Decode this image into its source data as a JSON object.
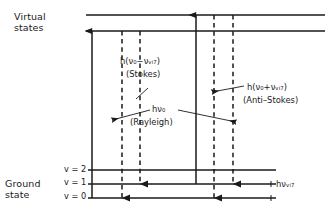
{
  "diagram": {
    "title_semantic": "raman-scattering-energy-level-diagram",
    "labels": {
      "virtual_states": "Virtual\nstates",
      "virtual_states_line1": "Virtual",
      "virtual_states_line2": "states",
      "ground_state_line1": "Ground",
      "ground_state_line2": "state",
      "v2": "v = 2",
      "v1": "v = 1",
      "v0": "v = 0",
      "stokes_energy": "h(ν₀−νᵥᵢ₇)",
      "stokes_name": "(Stokes)",
      "rayleigh_energy": "hν₀",
      "rayleigh_name": "(Rayleigh)",
      "antistokes_energy": "h(ν₀+νᵥᵢ₇)",
      "antistokes_name": "(Anti–Stokes)",
      "vib_energy": "hνᵥᵢ₇"
    },
    "colors": {
      "ink": "#1a1a1a",
      "background": "#ffffff"
    },
    "levels": {
      "virtual_upper_y": 15,
      "virtual_lower_y": 31,
      "v2_y": 170,
      "v1_y": 184,
      "v0_y": 198
    },
    "transitions": [
      {
        "name": "excitation-left",
        "style": "solid",
        "direction": "up",
        "x": 92
      },
      {
        "name": "stokes-emission",
        "style": "dashed",
        "direction": "down",
        "x": 122,
        "ends_at": "v0"
      },
      {
        "name": "rayleigh-emission-left",
        "style": "dashed",
        "direction": "down",
        "x": 140,
        "ends_at": "v1"
      },
      {
        "name": "excitation-right",
        "style": "solid",
        "direction": "up",
        "x": 196
      },
      {
        "name": "rayleigh-emission-right",
        "style": "dashed",
        "direction": "down",
        "x": 214,
        "ends_at": "v0"
      },
      {
        "name": "antistokes-emission",
        "style": "dashed",
        "direction": "down",
        "x": 233,
        "ends_at": "v1"
      }
    ]
  }
}
